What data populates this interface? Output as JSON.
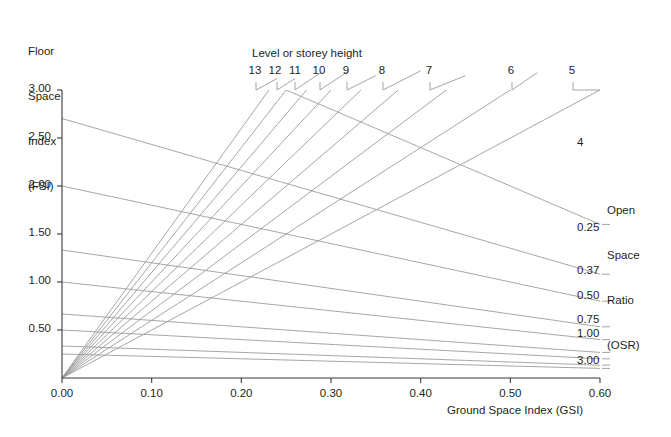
{
  "titles": {
    "y_axis": "Floor\nSpace\nIndex\n(FSI)",
    "y_axis_lines": [
      "Floor",
      "Space",
      "Index",
      "(FSI)"
    ],
    "x_axis": "Ground Space Index (GSI)",
    "right_axis": "Open\nSpace\nRatio\n(OSR)",
    "right_axis_lines": [
      "Open",
      "Space",
      "Ratio",
      "(OSR)"
    ],
    "storey_legend": "Level or storey height"
  },
  "colors": {
    "line": "#9a9a9a",
    "axis": "#3a3a3a",
    "text": "#231f20",
    "background": "#ffffff"
  },
  "chart_data": {
    "type": "line",
    "title": "",
    "xlabel": "Ground Space Index (GSI)",
    "ylabel": "Floor Space Index (FSI)",
    "xlim": [
      0.0,
      0.6
    ],
    "ylim": [
      0.0,
      3.0
    ],
    "grid": false,
    "legend_position": "top-and-right-end-labels",
    "xticks": [
      "0.00",
      "0.10",
      "0.20",
      "0.30",
      "0.40",
      "0.50",
      "0.60"
    ],
    "xtick_values": [
      0.0,
      0.1,
      0.2,
      0.3,
      0.4,
      0.5,
      0.6
    ],
    "yticks": [
      "3.00",
      "2.50",
      "2.00",
      "1.50",
      "1.00",
      "0.50"
    ],
    "ytick_values": [
      3.0,
      2.5,
      2.0,
      1.5,
      1.0,
      0.5
    ],
    "series": [
      {
        "name": "13",
        "kind": "storey",
        "label": "13",
        "L": 13,
        "label_x": 255,
        "tick_x": 256
      },
      {
        "name": "12",
        "kind": "storey",
        "label": "12",
        "L": 12,
        "label_x": 275,
        "tick_x": 277
      },
      {
        "name": "11",
        "kind": "storey",
        "label": "11",
        "L": 11,
        "label_x": 295,
        "tick_x": 295
      },
      {
        "name": "10",
        "kind": "storey",
        "label": "10",
        "L": 10,
        "label_x": 319,
        "tick_x": 320
      },
      {
        "name": "9",
        "kind": "storey",
        "label": "9",
        "L": 9,
        "label_x": 346,
        "tick_x": 347
      },
      {
        "name": "8",
        "kind": "storey",
        "label": "8",
        "L": 8,
        "label_x": 382,
        "tick_x": 383
      },
      {
        "name": "7",
        "kind": "storey",
        "label": "7",
        "L": 7,
        "label_x": 429,
        "tick_x": 430
      },
      {
        "name": "6",
        "kind": "storey",
        "label": "6",
        "L": 6,
        "label_x": 511,
        "tick_x": 512
      },
      {
        "name": "5",
        "kind": "storey",
        "label": "5",
        "L": 5,
        "label_x": 572,
        "tick_x": 573
      }
    ],
    "osr_curves": [
      {
        "name": "4",
        "label": "4",
        "osr": 4.0,
        "labeled": true
      },
      {
        "name": "0.25",
        "label": "0.25",
        "osr": 0.25,
        "labeled": true
      },
      {
        "name": "0.37",
        "label": "0.37",
        "osr": 0.37,
        "labeled": true
      },
      {
        "name": "0.50",
        "label": "0.50",
        "osr": 0.5,
        "labeled": true
      },
      {
        "name": "0.75",
        "label": "0.75",
        "osr": 0.75,
        "labeled": true
      },
      {
        "name": "1.00",
        "label": "1.00",
        "osr": 1.0,
        "labeled": true
      },
      {
        "name": "1.50",
        "label": "",
        "osr": 1.5,
        "labeled": false
      },
      {
        "name": "2.00",
        "label": "",
        "osr": 2.0,
        "labeled": false
      },
      {
        "name": "3.00",
        "label": "3.00",
        "osr": 3.0,
        "labeled": true
      }
    ],
    "osr_label_positions": [
      {
        "label": "4",
        "x": 577,
        "y": 144
      },
      {
        "label": "0.25",
        "x": 577,
        "y": 229
      },
      {
        "label": "0.37",
        "x": 577,
        "y": 272
      },
      {
        "label": "0.50",
        "x": 577,
        "y": 297
      },
      {
        "label": "0.75",
        "x": 577,
        "y": 321
      },
      {
        "label": "1.00",
        "x": 577,
        "y": 335
      },
      {
        "label": "3.00",
        "x": 577,
        "y": 362
      }
    ],
    "relations": {
      "fsi": "FSI = GSI x L",
      "osr": "OSR = (1 - GSI) / FSI"
    }
  }
}
